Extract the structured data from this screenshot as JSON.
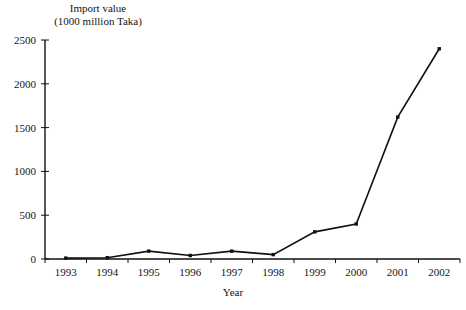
{
  "chart_data": {
    "type": "line",
    "title": "",
    "ylabel": "Import value\n(1000 million Taka)",
    "xlabel": "Year",
    "categories": [
      "1993",
      "1994",
      "1995",
      "1996",
      "1997",
      "1998",
      "1999",
      "2000",
      "2001",
      "2002"
    ],
    "values": [
      10,
      15,
      90,
      40,
      90,
      50,
      310,
      400,
      1620,
      2400
    ],
    "series": [
      {
        "name": "Import value",
        "values": [
          10,
          15,
          90,
          40,
          90,
          50,
          310,
          400,
          1620,
          2400
        ]
      }
    ],
    "ylim": [
      0,
      2500
    ],
    "y_ticks": [
      0,
      500,
      1000,
      1500,
      2000,
      2500
    ],
    "y_tick_labels": [
      "0",
      "500",
      "1000",
      "1500",
      "2000",
      "2500"
    ],
    "grid": false,
    "legend": "none",
    "marker": "square",
    "line_color": "#111111",
    "marker_color": "#111111",
    "axis_color": "#111111"
  },
  "axis_titles": {
    "y": "Import value\n(1000 million Taka)",
    "x": "Year"
  }
}
